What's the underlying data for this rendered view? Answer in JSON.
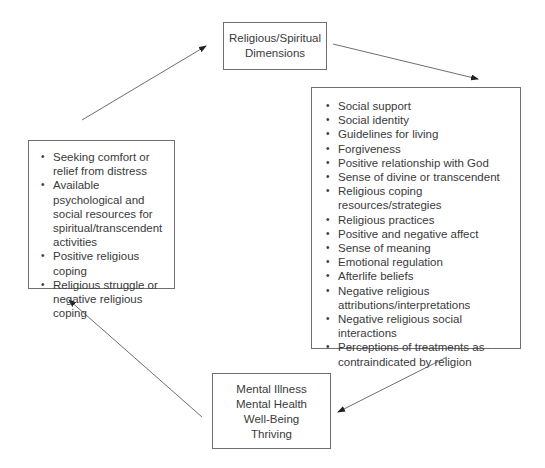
{
  "diagram": {
    "top_box": {
      "lines": [
        "Religious/Spiritual",
        "Dimensions"
      ]
    },
    "right_box": {
      "items": [
        "Social support",
        "Social identity",
        "Guidelines for living",
        "Forgiveness",
        "Positive relationship with God",
        "Sense of divine or transcendent",
        "Religious coping resources/strategies",
        "Religious practices",
        "Positive and negative affect",
        "Sense of meaning",
        "Emotional regulation",
        "Afterlife beliefs",
        "Negative religious attributions/interpretations",
        "Negative religious social interactions",
        "Perceptions of treatments as contraindicated by religion"
      ]
    },
    "bottom_box": {
      "lines": [
        "Mental Illness",
        "Mental Health",
        "Well-Being",
        "Thriving"
      ]
    },
    "left_box": {
      "items": [
        "Seeking comfort or relief from distress",
        "Available psychological and social resources for spiritual/transcendent activities",
        "Positive religious coping",
        "Religious struggle or negative religious coping"
      ]
    },
    "arrows": [
      {
        "from": "top_box",
        "to": "right_box"
      },
      {
        "from": "right_box",
        "to": "bottom_box"
      },
      {
        "from": "bottom_box",
        "to": "left_box"
      },
      {
        "from": "left_box",
        "to": "top_box"
      }
    ],
    "colors": {
      "line": "#6f6f6f",
      "text": "#3a3a3a",
      "arrowhead": "#222222"
    }
  }
}
